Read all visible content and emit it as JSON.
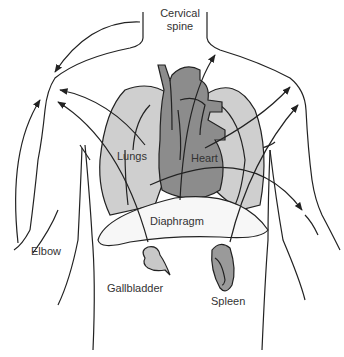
{
  "colors": {
    "background": "#ffffff",
    "outline": "#222222",
    "lung_fill": "#cfcfcf",
    "heart_fill": "#8c8c8c",
    "diaphragm_fill": "#f7f7f7",
    "gallbladder_fill": "#c8c8c8",
    "spleen_fill": "#9a9a9a",
    "label_text": "#333333"
  },
  "labels": {
    "cervical_spine_line1": "Cervical",
    "cervical_spine_line2": "spine",
    "lungs": "Lungs",
    "heart": "Heart",
    "diaphragm": "Diaphragm",
    "elbow": "Elbow",
    "gallbladder": "Gallbladder",
    "spleen": "Spleen"
  },
  "structures": [
    {
      "name": "body-outline",
      "description": "Torso, neck, shoulders and arms outline"
    },
    {
      "name": "lungs",
      "description": "Left and right lungs (light gray)"
    },
    {
      "name": "heart",
      "description": "Heart with great vessels (dark gray)"
    },
    {
      "name": "diaphragm",
      "description": "Crescent-shaped diaphragm (white)"
    },
    {
      "name": "gallbladder",
      "description": "Gallbladder (light gray) below right diaphragm"
    },
    {
      "name": "spleen",
      "description": "Spleen (dark gray) below left diaphragm"
    }
  ],
  "pathways": [
    {
      "from": "cervical spine",
      "to": "left shoulder"
    },
    {
      "from": "elbow",
      "to": "left shoulder"
    },
    {
      "from": "lungs",
      "to": "left shoulder"
    },
    {
      "from": "gallbladder",
      "to": "left shoulder"
    },
    {
      "from": "heart",
      "to": "neck"
    },
    {
      "from": "heart",
      "to": "right shoulder"
    },
    {
      "from": "spleen",
      "to": "right shoulder"
    },
    {
      "from": "heart",
      "to": "right arm"
    }
  ]
}
